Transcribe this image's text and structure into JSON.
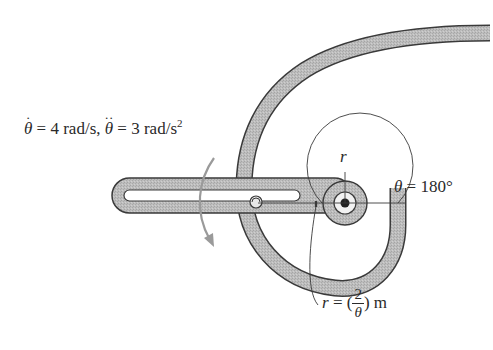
{
  "figure": {
    "type": "engineering mechanics diagram — slotted arm with spiral guide",
    "given": {
      "theta_dot_symbol": "θ",
      "theta_dot_value": "= 4 rad/s,",
      "theta_ddot_symbol": "θ",
      "theta_ddot_value": "= 3 rad/s",
      "theta_ddot_exp": "2"
    },
    "angle_label": {
      "symbol": "θ",
      "value": "= 180°"
    },
    "radial_axis_label": "r",
    "path_equation": {
      "lhs": "r",
      "eq": "= (",
      "numerator": "2",
      "denominator": "θ",
      "rhs": ") m"
    },
    "colors": {
      "stroke": "#3a3a3a",
      "fill": "#b8b8b8",
      "background": "#ffffff"
    }
  }
}
